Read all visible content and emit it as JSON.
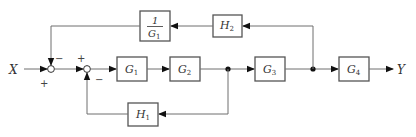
{
  "diagram": {
    "type": "control-system block diagram",
    "input": {
      "label": "X"
    },
    "output": {
      "label": "Y"
    },
    "summing_junctions": [
      {
        "id": "sum1",
        "signs": {
          "input_X": "+",
          "feedback_top": "−"
        }
      },
      {
        "id": "sum2",
        "signs": {
          "input_left": "+",
          "feedback_bottom": "−"
        }
      }
    ],
    "blocks": [
      {
        "id": "G1",
        "symbol": "G",
        "sub": "1"
      },
      {
        "id": "G2",
        "symbol": "G",
        "sub": "2"
      },
      {
        "id": "G3",
        "symbol": "G",
        "sub": "3"
      },
      {
        "id": "G4",
        "symbol": "G",
        "sub": "4"
      },
      {
        "id": "H1",
        "symbol": "H",
        "sub": "1"
      },
      {
        "id": "H2",
        "symbol": "H",
        "sub": "2"
      },
      {
        "id": "invG1",
        "numerator": "1",
        "symbol": "G",
        "sub": "1"
      }
    ],
    "signs": {
      "sum1_bottom": "+",
      "sum1_top": "−",
      "sum2_top": "+",
      "sum2_bottom": "−"
    },
    "connections": [
      "X → sum1(+)",
      "sum1 → sum2(+)",
      "sum2 → G1 → G2 → node1 → G3 → node2 → G4 → Y",
      "node1 → H1 → sum2(−)",
      "node2 → H2 → 1/G1 → sum1(−)"
    ]
  }
}
